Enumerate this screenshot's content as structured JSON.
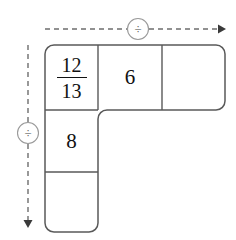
{
  "canvas": {
    "width": 236,
    "height": 240,
    "background": "#ffffff"
  },
  "colors": {
    "grid_stroke": "#595959",
    "guide_stroke": "#6e6e6e",
    "text": "#111111",
    "operator_text": "#444444",
    "circle_stroke": "#9a9a9a"
  },
  "guides": {
    "horizontal": {
      "name": "horizontal-division-guide",
      "operator_symbol": "÷",
      "direction": "right",
      "style": "dashed",
      "x_start": 45,
      "x_end": 225,
      "y": 29,
      "circle_cx": 138,
      "circle_r": 11
    },
    "vertical": {
      "name": "vertical-division-guide",
      "operator_symbol": "÷",
      "direction": "down",
      "style": "dashed",
      "y_start": 45,
      "y_end": 228,
      "x": 28,
      "circle_cy": 133,
      "circle_r": 11
    }
  },
  "grid": {
    "shape": "L",
    "corner_radius": 9,
    "top_row": {
      "y_top": 45,
      "y_bottom": 110,
      "cells": [
        {
          "id": "cell-r1c1",
          "x": 45,
          "width": 53,
          "type": "fraction",
          "numerator": "12",
          "denominator": "13",
          "value": "12/13"
        },
        {
          "id": "cell-r1c2",
          "x": 98,
          "width": 64,
          "type": "number",
          "value": "6"
        },
        {
          "id": "cell-r1c3",
          "x": 162,
          "width": 63,
          "type": "empty",
          "value": ""
        }
      ]
    },
    "left_column": {
      "x": 45,
      "width": 53,
      "cells": [
        {
          "id": "cell-r2c1",
          "y": 110,
          "height": 62,
          "type": "number",
          "value": "8"
        },
        {
          "id": "cell-r3c1",
          "y": 172,
          "height": 60,
          "type": "empty",
          "value": ""
        }
      ]
    }
  }
}
